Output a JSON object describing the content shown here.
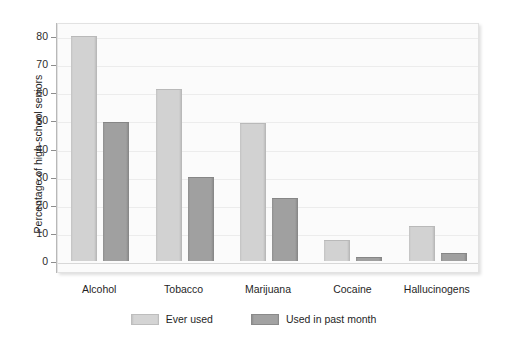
{
  "chart_data": {
    "type": "bar",
    "title": "",
    "subtitle": "",
    "xlabel": "",
    "ylabel": "Percentage of high-school seniors",
    "ylim": [
      0,
      85
    ],
    "yticks": [
      0,
      10,
      20,
      30,
      40,
      50,
      60,
      70,
      80
    ],
    "ytick_labels": [
      "0",
      "10",
      "20",
      "30",
      "40",
      "50",
      "60",
      "70",
      "80"
    ],
    "grid": true,
    "legend_position": "bottom",
    "categories": [
      "Alcohol",
      "Tobacco",
      "Marijuana",
      "Cocaine",
      "Hallucinogens"
    ],
    "series": [
      {
        "name": "Ever used",
        "color": "#d2d2d2",
        "values": [
          80,
          61,
          49,
          7.5,
          12.5
        ]
      },
      {
        "name": "Used in past month",
        "color": "#a0a0a0",
        "values": [
          49.5,
          30,
          22.5,
          1.5,
          3
        ]
      }
    ]
  },
  "colors": {
    "plot_background": "#fbfbfb",
    "gridline": "#ececec",
    "axis": "#b9b9b9",
    "series_light": "#d2d2d2",
    "series_dark": "#a0a0a0",
    "text": "#1f1f1f"
  }
}
